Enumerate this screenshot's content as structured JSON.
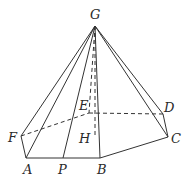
{
  "diagram": {
    "type": "hexagonal pyramid",
    "labels": {
      "G": "G",
      "E": "E",
      "D": "D",
      "F": "F",
      "H": "H",
      "C": "C",
      "A": "A",
      "P": "P",
      "B": "B"
    },
    "points": {
      "G": [
        95,
        26
      ],
      "A": [
        26,
        158
      ],
      "P": [
        63,
        158
      ],
      "B": [
        100,
        158
      ],
      "C": [
        168,
        137
      ],
      "D": [
        163,
        114
      ],
      "E": [
        89,
        113
      ],
      "F": [
        21,
        136
      ],
      "H": [
        95,
        138
      ]
    },
    "solid_edges": [
      [
        "G",
        "A"
      ],
      [
        "G",
        "F"
      ],
      [
        "G",
        "P"
      ],
      [
        "G",
        "B"
      ],
      [
        "G",
        "C"
      ],
      [
        "G",
        "D"
      ],
      [
        "F",
        "A"
      ],
      [
        "A",
        "B"
      ],
      [
        "B",
        "C"
      ],
      [
        "C",
        "D"
      ]
    ],
    "dashed_edges": [
      [
        "F",
        "E"
      ],
      [
        "E",
        "D"
      ],
      [
        "G",
        "E"
      ],
      [
        "G",
        "H"
      ]
    ],
    "colors": {
      "line": "#333333",
      "text": "#2a2a2a",
      "background": "#ffffff"
    }
  }
}
